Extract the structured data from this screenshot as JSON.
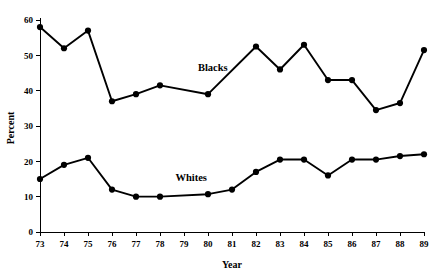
{
  "chart_data": {
    "type": "line",
    "title": "",
    "xlabel": "Year",
    "ylabel": "Percent",
    "xlim": [
      73,
      89
    ],
    "ylim": [
      0,
      60
    ],
    "grid": false,
    "legend_position": "inline-labels",
    "x": [
      73,
      74,
      75,
      76,
      77,
      78,
      79,
      80,
      81,
      82,
      83,
      84,
      85,
      86,
      87,
      88,
      89
    ],
    "categories": [
      "73",
      "74",
      "75",
      "76",
      "77",
      "78",
      "79",
      "80",
      "81",
      "82",
      "83",
      "84",
      "85",
      "86",
      "87",
      "88",
      "89"
    ],
    "ytick_labels": [
      "0",
      "10",
      "20",
      "30",
      "40",
      "50",
      "60"
    ],
    "yticks": [
      0,
      10,
      20,
      30,
      40,
      50,
      60
    ],
    "series": [
      {
        "name": "Blacks",
        "label_x": 80.2,
        "label_y": 45.5,
        "points": [
          {
            "x": 73,
            "y": 58
          },
          {
            "x": 74,
            "y": 52
          },
          {
            "x": 75,
            "y": 57
          },
          {
            "x": 76,
            "y": 37
          },
          {
            "x": 77,
            "y": 39
          },
          {
            "x": 78,
            "y": 41.5
          },
          {
            "x": 80,
            "y": 39
          },
          {
            "x": 82,
            "y": 52.5
          },
          {
            "x": 83,
            "y": 46
          },
          {
            "x": 84,
            "y": 53
          },
          {
            "x": 85,
            "y": 43
          },
          {
            "x": 86,
            "y": 43
          },
          {
            "x": 87,
            "y": 34.5
          },
          {
            "x": 88,
            "y": 36.5
          },
          {
            "x": 89,
            "y": 51.5
          }
        ]
      },
      {
        "name": "Whites",
        "label_x": 79.3,
        "label_y": 14.5,
        "points": [
          {
            "x": 73,
            "y": 15
          },
          {
            "x": 74,
            "y": 19
          },
          {
            "x": 75,
            "y": 21
          },
          {
            "x": 76,
            "y": 12
          },
          {
            "x": 77,
            "y": 10
          },
          {
            "x": 78,
            "y": 10
          },
          {
            "x": 80,
            "y": 10.7
          },
          {
            "x": 81,
            "y": 12
          },
          {
            "x": 82,
            "y": 17
          },
          {
            "x": 83,
            "y": 20.5
          },
          {
            "x": 84,
            "y": 20.5
          },
          {
            "x": 85,
            "y": 16
          },
          {
            "x": 86,
            "y": 20.5
          },
          {
            "x": 87,
            "y": 20.5
          },
          {
            "x": 88,
            "y": 21.5
          },
          {
            "x": 89,
            "y": 22
          }
        ]
      }
    ]
  },
  "axes": {
    "y_title": "Percent",
    "x_title": "Year"
  },
  "colors": {
    "line": "#000000",
    "marker": "#000000",
    "axis": "#000000",
    "background": "#ffffff"
  }
}
